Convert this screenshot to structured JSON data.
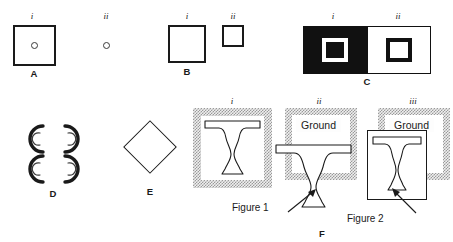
{
  "figure": {
    "caption_letters": [
      "A",
      "B",
      "C",
      "D",
      "E",
      "F"
    ],
    "roman_numerals": [
      "i",
      "ii",
      "iii"
    ],
    "background_color": "#ffffff",
    "ink_color": "#1a1a1a",
    "frame_hatch_color": "#9a9a9a"
  },
  "panels": {
    "a": {
      "letter": "A",
      "sub_i": "i",
      "sub_ii": "ii",
      "i_description": "large square outline containing a small circle",
      "ii_description": "small circle alone"
    },
    "b": {
      "letter": "B",
      "sub_i": "i",
      "sub_ii": "ii",
      "i_description": "large square outline",
      "ii_description": "small square outline"
    },
    "c": {
      "letter": "C",
      "sub_i": "i",
      "sub_ii": "ii",
      "i_description": "white square ring on black field",
      "ii_description": "black square ring on white field",
      "black": "#111111",
      "white": "#ffffff"
    },
    "d": {
      "letter": "D",
      "description": "four nested C shaped arcs arranged in a pinwheel forming an illusory square"
    },
    "e": {
      "letter": "E",
      "description": "diamond outline (square rotated 45 degrees)"
    },
    "f": {
      "letter": "F",
      "sub_i": "i",
      "sub_ii": "ii",
      "sub_iii": "iii",
      "ground_label_ii": "Ground",
      "ground_label_iii": "Ground",
      "callout_figure_1": "Figure 1",
      "callout_figure_2": "Figure 2",
      "i_description": "Rubin vase outline centred inside hatched frame",
      "ii_description": "vase shifted down so its base breaks out of the hatched frame",
      "iii_description": "vase inside a solid white plate overlapping the hatched frame"
    }
  }
}
